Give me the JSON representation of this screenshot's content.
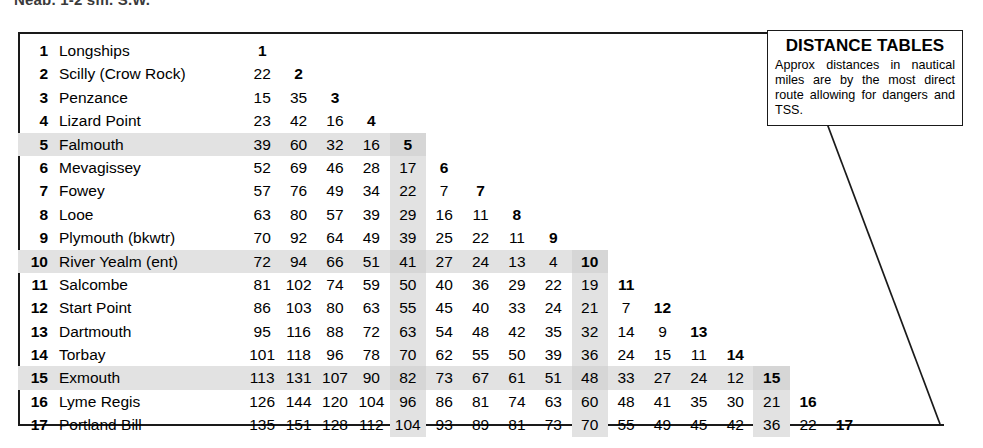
{
  "top_cut_text": "Neap, 1-2 sm. S.W.",
  "info_box": {
    "title": "DISTANCE TABLES",
    "body": "Approx distances in nautical miles are by the most direct route allowing for dangers and TSS."
  },
  "shaded_indices": [
    5,
    10,
    15
  ],
  "chart_data": {
    "type": "table",
    "title": "DISTANCE TABLES",
    "subtitle": "Approx distances in nautical miles are by the most direct route allowing for dangers and TSS.",
    "units": "nautical miles",
    "form": "lower-triangular distance matrix",
    "row_count": 17,
    "column_count": 17,
    "highlighted_rows": [
      5,
      10,
      15
    ],
    "highlighted_columns": [
      5,
      10,
      15
    ],
    "places": [
      "Longships",
      "Scilly (Crow Rock)",
      "Penzance",
      "Lizard Point",
      "Falmouth",
      "Mevagissey",
      "Fowey",
      "Looe",
      "Plymouth (bkwtr)",
      "River Yealm (ent)",
      "Salcombe",
      "Start Point",
      "Dartmouth",
      "Torbay",
      "Exmouth",
      "Lyme Regis",
      "Portland Bill"
    ],
    "rows": [
      {
        "index": 1,
        "name": "Longships",
        "values": [
          1
        ]
      },
      {
        "index": 2,
        "name": "Scilly (Crow Rock)",
        "values": [
          22,
          2
        ]
      },
      {
        "index": 3,
        "name": "Penzance",
        "values": [
          15,
          35,
          3
        ]
      },
      {
        "index": 4,
        "name": "Lizard Point",
        "values": [
          23,
          42,
          16,
          4
        ]
      },
      {
        "index": 5,
        "name": "Falmouth",
        "values": [
          39,
          60,
          32,
          16,
          5
        ]
      },
      {
        "index": 6,
        "name": "Mevagissey",
        "values": [
          52,
          69,
          46,
          28,
          17,
          6
        ]
      },
      {
        "index": 7,
        "name": "Fowey",
        "values": [
          57,
          76,
          49,
          34,
          22,
          7,
          7
        ]
      },
      {
        "index": 8,
        "name": "Looe",
        "values": [
          63,
          80,
          57,
          39,
          29,
          16,
          11,
          8
        ]
      },
      {
        "index": 9,
        "name": "Plymouth (bkwtr)",
        "values": [
          70,
          92,
          64,
          49,
          39,
          25,
          22,
          11,
          9
        ]
      },
      {
        "index": 10,
        "name": "River Yealm (ent)",
        "values": [
          72,
          94,
          66,
          51,
          41,
          27,
          24,
          13,
          4,
          10
        ]
      },
      {
        "index": 11,
        "name": "Salcombe",
        "values": [
          81,
          102,
          74,
          59,
          50,
          40,
          36,
          29,
          22,
          19,
          11
        ]
      },
      {
        "index": 12,
        "name": "Start Point",
        "values": [
          86,
          103,
          80,
          63,
          55,
          45,
          40,
          33,
          24,
          21,
          7,
          12
        ]
      },
      {
        "index": 13,
        "name": "Dartmouth",
        "values": [
          95,
          116,
          88,
          72,
          63,
          54,
          48,
          42,
          35,
          32,
          14,
          9,
          13
        ]
      },
      {
        "index": 14,
        "name": "Torbay",
        "values": [
          101,
          118,
          96,
          78,
          70,
          62,
          55,
          50,
          39,
          36,
          24,
          15,
          11,
          14
        ]
      },
      {
        "index": 15,
        "name": "Exmouth",
        "values": [
          113,
          131,
          107,
          90,
          82,
          73,
          67,
          61,
          51,
          48,
          33,
          27,
          24,
          12,
          15
        ]
      },
      {
        "index": 16,
        "name": "Lyme Regis",
        "values": [
          126,
          144,
          120,
          104,
          96,
          86,
          81,
          74,
          63,
          60,
          48,
          41,
          35,
          30,
          21,
          16
        ]
      },
      {
        "index": 17,
        "name": "Portland Bill",
        "values": [
          135,
          151,
          128,
          112,
          104,
          93,
          89,
          81,
          73,
          70,
          55,
          49,
          45,
          42,
          36,
          22,
          17
        ]
      }
    ]
  }
}
